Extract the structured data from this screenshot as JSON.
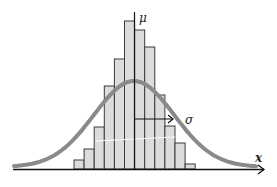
{
  "chart_data": {
    "type": "bar",
    "title": "",
    "xlabel": "x",
    "ylabel": "",
    "grid": false,
    "legend": null,
    "categories": [
      "b1",
      "b2",
      "b3",
      "b4",
      "b5",
      "b6",
      "b7",
      "b8",
      "b9",
      "b10",
      "b11",
      "b12"
    ],
    "values": [
      9,
      20,
      42,
      83,
      110,
      148,
      139,
      122,
      74,
      43,
      26,
      5
    ],
    "overlay": {
      "type": "line",
      "name": "normal distribution curve",
      "mean_label": "μ",
      "sigma_label": "σ",
      "peak_relative": 88
    },
    "annotations": [
      {
        "text": "μ",
        "meaning": "mean (vertical line at center)"
      },
      {
        "text": "σ",
        "meaning": "standard deviation (horizontal arrow from mean)"
      },
      {
        "text": "x",
        "meaning": "horizontal axis label"
      }
    ]
  },
  "labels": {
    "mu": "μ",
    "sigma": "σ",
    "x": "x"
  },
  "colors": {
    "bar_fill": "#dcdcdc",
    "bar_stroke": "#3a3a3a",
    "curve": "#8a8a8a",
    "axis": "#111111"
  }
}
